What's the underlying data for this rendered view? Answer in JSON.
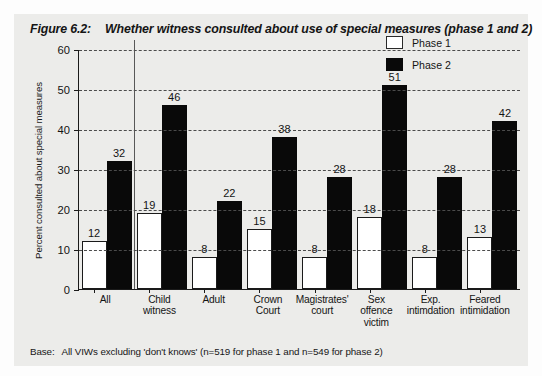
{
  "figure": {
    "number_label": "Figure 6.2:",
    "title": "Whether witness consulted about use of special measures (phase 1 and 2)",
    "footnote_label": "Base:",
    "footnote_text": "All VIWs excluding 'don't knows' (n=519 for phase 1 and n=549 for phase 2)"
  },
  "legend": {
    "position": "top-right",
    "items": [
      {
        "label": "Phase 1",
        "color": "#ffffff"
      },
      {
        "label": "Phase 2",
        "color": "#090909"
      }
    ]
  },
  "chart_data": {
    "type": "bar",
    "title": "Whether witness consulted about use of special measures (phase 1 and 2)",
    "xlabel": "",
    "ylabel": "Percent consulted about special measures",
    "ylim": [
      0,
      60
    ],
    "yticks": [
      0,
      10,
      20,
      30,
      40,
      50,
      60
    ],
    "grid": true,
    "grid_style": "dashed-horizontal",
    "legend_position": "top-right",
    "categories": [
      "All",
      "Child witness",
      "Adult",
      "Crown Court",
      "Magistrates' court",
      "Sex offence victim",
      "Exp. intimdation",
      "Feared intimidation"
    ],
    "category_lines": [
      [
        "All"
      ],
      [
        "Child witness"
      ],
      [
        "Adult"
      ],
      [
        "Crown",
        "Court"
      ],
      [
        "Magistrates'",
        "court"
      ],
      [
        "Sex",
        "offence",
        "victim"
      ],
      [
        "Exp.",
        "intimdation"
      ],
      [
        "Feared",
        "intimidation"
      ]
    ],
    "series": [
      {
        "name": "Phase 1",
        "color": "#ffffff",
        "values": [
          12,
          19,
          8,
          15,
          8,
          18,
          8,
          13
        ]
      },
      {
        "name": "Phase 2",
        "color": "#090909",
        "values": [
          32,
          46,
          22,
          38,
          28,
          51,
          28,
          42
        ]
      }
    ],
    "separator_after_category_index": 0,
    "data_labels": true
  }
}
